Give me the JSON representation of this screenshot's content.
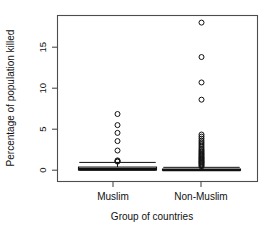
{
  "chart_data": {
    "type": "box",
    "title": "",
    "xlabel": "Group of countries",
    "ylabel": "Percentage of population killed",
    "ylim": [
      -1.0,
      18.8
    ],
    "yticks": [
      0,
      5,
      10,
      15
    ],
    "ytick_labels": [
      "0",
      "5",
      "10",
      "15"
    ],
    "categories": [
      "Muslim",
      "Non-Muslim"
    ],
    "grid": false,
    "legend": null,
    "boxes": [
      {
        "name": "Muslim",
        "center_frac": 0.3,
        "q1": 0.02,
        "median": 0.12,
        "q3": 0.38,
        "whisker_low": 0.0,
        "whisker_high": 0.95,
        "outliers": [
          1.05,
          1.12,
          1.2,
          2.4,
          3.55,
          4.55,
          5.5,
          6.85
        ]
      },
      {
        "name": "Non-Muslim",
        "center_frac": 0.72,
        "q1": 0.0,
        "median": 0.02,
        "q3": 0.14,
        "whisker_low": 0.0,
        "whisker_high": 0.35,
        "outliers": [
          0.45,
          0.6,
          0.72,
          0.85,
          0.95,
          1.05,
          1.15,
          1.28,
          1.4,
          1.5,
          1.62,
          1.75,
          1.88,
          2.0,
          2.15,
          2.3,
          2.45,
          2.6,
          2.8,
          3.0,
          3.2,
          3.4,
          3.6,
          3.85,
          4.1,
          4.35,
          8.6,
          10.7,
          13.8,
          18.0
        ]
      }
    ]
  },
  "axis": {
    "y_title": "Percentage of population killed",
    "x_title": "Group of countries",
    "y_tick_0": "0",
    "y_tick_5": "5",
    "y_tick_10": "10",
    "y_tick_15": "15",
    "x_tick_muslim": "Muslim",
    "x_tick_non_muslim": "Non-Muslim"
  },
  "colors": {
    "background": "#ffffff",
    "frame": "#4d4d4d",
    "ink": "#111111",
    "box_fill": "#f2f2f2"
  }
}
